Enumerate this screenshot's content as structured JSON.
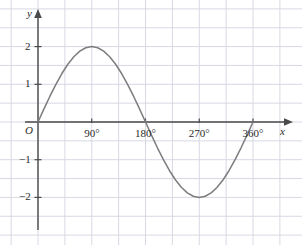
{
  "chart_data": {
    "type": "line",
    "title": "",
    "subtitle": "",
    "xlabel": "x",
    "ylabel": "y",
    "origin_label": "O",
    "function": "y = 2 sin(x)",
    "amplitude": 2,
    "period_degrees": 360,
    "xlim": [
      0,
      360
    ],
    "ylim": [
      -2.8,
      2.8
    ],
    "grid": true,
    "grid_step_x_degrees": 45,
    "grid_step_y": 0.5,
    "legend": null,
    "curve_color": "#7d7d7d",
    "axis_color": "#4a4a4a",
    "grid_color": "#d8d8e4",
    "x_ticks": [
      {
        "value": 90,
        "label": "90°"
      },
      {
        "value": 180,
        "label": "180°"
      },
      {
        "value": 270,
        "label": "270°"
      },
      {
        "value": 360,
        "label": "360°"
      }
    ],
    "y_ticks": [
      {
        "value": 2,
        "label": "2"
      },
      {
        "value": 1,
        "label": "1"
      },
      {
        "value": -1,
        "label": "−1"
      },
      {
        "value": -2,
        "label": "−2"
      }
    ],
    "key_points": [
      {
        "x": 0,
        "y": 0
      },
      {
        "x": 90,
        "y": 2
      },
      {
        "x": 180,
        "y": 0
      },
      {
        "x": 270,
        "y": -2
      },
      {
        "x": 360,
        "y": 0
      }
    ],
    "x": [
      0,
      10,
      20,
      30,
      40,
      50,
      60,
      70,
      80,
      90,
      100,
      110,
      120,
      130,
      140,
      150,
      160,
      170,
      180,
      190,
      200,
      210,
      220,
      230,
      240,
      250,
      260,
      270,
      280,
      290,
      300,
      310,
      320,
      330,
      340,
      350,
      360
    ],
    "values": [
      0,
      0.347,
      0.684,
      1,
      1.286,
      1.532,
      1.732,
      1.879,
      1.97,
      2,
      1.97,
      1.879,
      1.732,
      1.532,
      1.286,
      1,
      0.684,
      0.347,
      0,
      -0.347,
      -0.684,
      -1,
      -1.286,
      -1.532,
      -1.732,
      -1.879,
      -1.97,
      -2,
      -1.97,
      -1.879,
      -1.732,
      -1.532,
      -1.286,
      -1,
      -0.684,
      -0.347,
      0
    ]
  }
}
